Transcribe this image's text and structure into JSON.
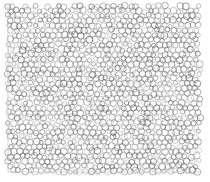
{
  "image": {
    "kind": "bubble-packing-texture",
    "description": "Dense irregular packing of small circular cells (foam / bubble raft micrograph style) filling a square region on a white background",
    "width": 210,
    "height": 182,
    "background_color": "#ffffff",
    "has_text": false,
    "has_axes": false,
    "has_legend": false,
    "has_ui_chrome": false
  },
  "pattern": {
    "region": {
      "x": 8,
      "y": 6,
      "width": 192,
      "height": 166
    },
    "cell_shape": "circle",
    "cell_outline_color": "#555555",
    "cell_outline_width": 0.55,
    "cell_fill": "none",
    "cell_diameter_px_min": 4.0,
    "cell_diameter_px_max": 7.2,
    "cell_diameter_px_mean": 5.6,
    "packing": "jittered-hexagonal",
    "row_spacing_px": 4.85,
    "column_spacing_px": 5.6,
    "position_jitter_px": 1.15,
    "radius_jitter_fraction": 0.26,
    "approx_cell_count": 1180,
    "opacity_min": 0.45,
    "opacity_max": 0.95,
    "random_seed": 20250411
  },
  "frame": {
    "visible_edges": [
      "left",
      "bottom"
    ],
    "color": "#b9b9b9",
    "width": 0.6,
    "left_x": 8.0,
    "bottom_y": 172.0,
    "right_x": 200.0,
    "top_y": 6.0
  },
  "margins": {
    "left": 8,
    "top": 6,
    "right": 10,
    "bottom": 10
  }
}
